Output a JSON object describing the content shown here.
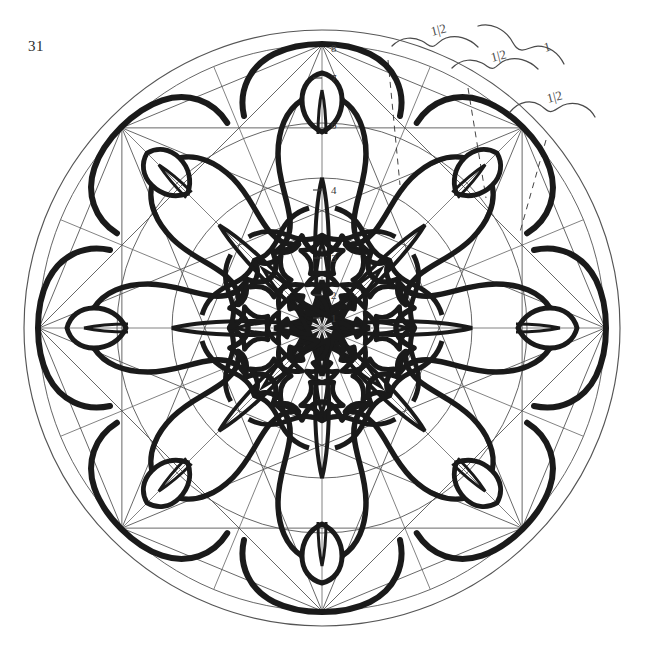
{
  "document": {
    "page_number": "31",
    "title": "Geometric construction of an eightfold arabesque rosette",
    "media": "pencil and ink on paper",
    "background_color": "#ffffff",
    "ink_color": "#1a1a1a",
    "construction_line_color": "#555555"
  },
  "figure": {
    "center": {
      "x": 322,
      "y": 328
    },
    "outer_radius": 298,
    "symmetry_order": 8,
    "circles": [
      {
        "name": "outer-circle",
        "radius": 298
      },
      {
        "name": "polygon-circumcircle",
        "radius": 283
      },
      {
        "name": "petal-circle",
        "radius": 205
      },
      {
        "name": "mid-circle",
        "radius": 150
      },
      {
        "name": "inner-circle",
        "radius": 92
      }
    ],
    "radial_divisions": 16,
    "numbered_axis": {
      "label": "vertical radius division marks",
      "marks": [
        {
          "value": "8",
          "y": 48
        },
        {
          "value": "7",
          "y": 78
        },
        {
          "value": "6",
          "y": 125
        },
        {
          "value": "4",
          "y": 190
        },
        {
          "value": "3",
          "y": 258
        },
        {
          "value": "2",
          "y": 295
        },
        {
          "value": "1",
          "y": 318
        }
      ]
    }
  },
  "annotations": {
    "heading": "proportion marks",
    "items": [
      {
        "id": "brace-1",
        "text": "1|2",
        "x": 432,
        "y": 36
      },
      {
        "id": "brace-2",
        "text": "1|2",
        "x": 492,
        "y": 62
      },
      {
        "id": "brace-3",
        "text": "1",
        "x": 545,
        "y": 52
      },
      {
        "id": "brace-4",
        "text": "1|2",
        "x": 548,
        "y": 103
      }
    ]
  },
  "chart_data": {
    "type": "diagram"
  }
}
